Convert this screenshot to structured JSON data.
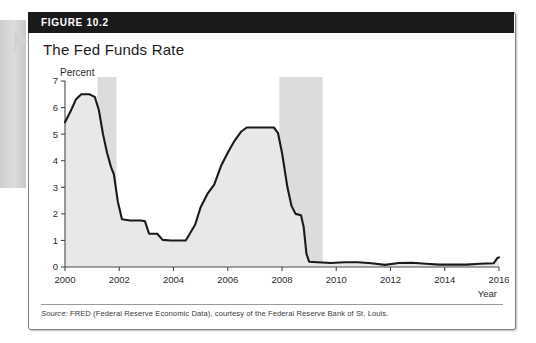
{
  "figure": {
    "number_label": "FIGURE 10.2",
    "title": "The Fed Funds Rate",
    "source_label": "Source:",
    "source_text": " FRED (Federal Reserve Economic Data), courtesy of the Federal Reserve Bank of St. Louis."
  },
  "colors": {
    "header_bar": "#1a1a1a",
    "line": "#1a1a1a",
    "area_fill": "#e8e8e8",
    "recession_band": "#dcdcdc",
    "axis": "#4a4a4a",
    "card_border": "#7f7f7f",
    "tab": "#d2d2d2"
  },
  "chart_data": {
    "type": "area",
    "title": "The Fed Funds Rate",
    "xlabel": "Year",
    "ylabel": "Percent",
    "xlim": [
      2000,
      2016
    ],
    "ylim": [
      0,
      7
    ],
    "grid": false,
    "legend": "none",
    "ytick_labels": [
      "0",
      "1",
      "2",
      "3",
      "4",
      "5",
      "6",
      "7"
    ],
    "ytick_values": [
      0,
      1,
      2,
      3,
      4,
      5,
      6,
      7
    ],
    "xtick_labels": [
      "2000",
      "2002",
      "2004",
      "2006",
      "2008",
      "2010",
      "2012",
      "2014",
      "2016"
    ],
    "xtick_values": [
      2000,
      2002,
      2004,
      2006,
      2008,
      2010,
      2012,
      2014,
      2016
    ],
    "shaded_regions": [
      {
        "label": "2001 recession",
        "x0": 2001.2,
        "x1": 2001.9
      },
      {
        "label": "2007-2009 recession",
        "x0": 2007.9,
        "x1": 2009.5
      }
    ],
    "series": [
      {
        "name": "Effective Federal Funds Rate",
        "x": [
          2000.0,
          2000.2,
          2000.4,
          2000.6,
          2000.9,
          2001.0,
          2001.1,
          2001.25,
          2001.4,
          2001.55,
          2001.7,
          2001.8,
          2001.95,
          2002.1,
          2002.4,
          2002.8,
          2002.95,
          2003.1,
          2003.4,
          2003.6,
          2003.9,
          2004.2,
          2004.45,
          2004.6,
          2004.8,
          2005.0,
          2005.25,
          2005.5,
          2005.75,
          2006.0,
          2006.25,
          2006.5,
          2006.7,
          2007.0,
          2007.4,
          2007.7,
          2007.85,
          2008.0,
          2008.2,
          2008.35,
          2008.5,
          2008.7,
          2008.8,
          2008.9,
          2009.0,
          2009.3,
          2009.8,
          2010.3,
          2010.8,
          2011.3,
          2011.8,
          2012.3,
          2012.8,
          2013.3,
          2013.8,
          2014.3,
          2014.8,
          2015.3,
          2015.8,
          2015.95,
          2016.0
        ],
        "y": [
          5.45,
          5.85,
          6.3,
          6.5,
          6.5,
          6.45,
          6.4,
          5.9,
          5.0,
          4.3,
          3.75,
          3.5,
          2.45,
          1.8,
          1.75,
          1.75,
          1.72,
          1.25,
          1.25,
          1.02,
          1.0,
          1.0,
          1.0,
          1.25,
          1.6,
          2.25,
          2.75,
          3.1,
          3.8,
          4.3,
          4.75,
          5.1,
          5.25,
          5.25,
          5.25,
          5.25,
          5.05,
          4.3,
          3.0,
          2.3,
          2.0,
          1.95,
          1.5,
          0.5,
          0.2,
          0.18,
          0.15,
          0.18,
          0.18,
          0.14,
          0.08,
          0.15,
          0.16,
          0.12,
          0.09,
          0.09,
          0.09,
          0.12,
          0.14,
          0.35,
          0.36
        ]
      }
    ]
  }
}
